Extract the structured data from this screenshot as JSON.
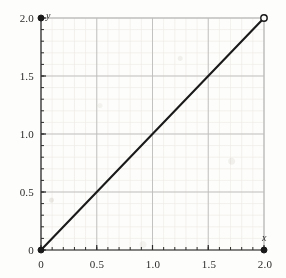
{
  "chart_data": {
    "type": "line",
    "title": "",
    "xlabel": "x",
    "ylabel": "y",
    "xlim": [
      0,
      2.0
    ],
    "ylim": [
      0,
      2.0
    ],
    "grid": true,
    "legend": "none",
    "x_ticks": [
      "0",
      "0.5",
      "1.0",
      "1.5",
      "2.0"
    ],
    "x_tick_values": [
      0,
      0.5,
      1.0,
      1.5,
      2.0
    ],
    "y_ticks": [
      "0",
      "0.5",
      "1.0",
      "1.5",
      "2.0"
    ],
    "y_tick_values": [
      0,
      0.5,
      1.0,
      1.5,
      2.0
    ],
    "minor_tick_step": 0.1,
    "series": [
      {
        "name": "y = x",
        "x": [
          0,
          2.0
        ],
        "values": [
          0,
          2.0
        ]
      }
    ],
    "markers": [
      {
        "name": "origin-filled-point",
        "x": 0,
        "y": 0,
        "style": "filled"
      },
      {
        "name": "y-axis-top-filled-point",
        "x": 0,
        "y": 2.0,
        "style": "filled"
      },
      {
        "name": "x-axis-right-filled-point",
        "x": 2.0,
        "y": 0,
        "style": "filled"
      },
      {
        "name": "line-endpoint-open-point",
        "x": 2.0,
        "y": 2.0,
        "style": "open"
      }
    ],
    "colors": {
      "line": "#1a1a1a",
      "major_grid": "#b9b9b9",
      "minor_grid": "#e8e6e0",
      "axis": "#2b2b2b",
      "background": "#fdfdfb",
      "tick_label": "#2b2b2b"
    }
  },
  "axis_names": {
    "x": "x",
    "y": "y"
  }
}
